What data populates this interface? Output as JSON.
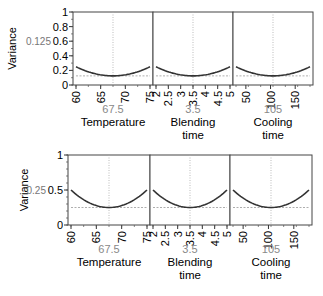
{
  "chart_data": [
    {
      "type": "line",
      "title": "Prediction variance profile (top)",
      "ylabel": "Variance",
      "y_current_value": "0.125",
      "ylim": [
        0,
        1
      ],
      "yticks": [
        "0",
        "0.2",
        "0.4",
        "0.6",
        "0.8",
        "1"
      ],
      "reference_line_y": 0.125,
      "panels": [
        {
          "factor": "Temperature",
          "current": "67.5",
          "xlim": [
            60,
            75
          ],
          "xticks": [
            "60",
            "65",
            "70",
            "75"
          ],
          "x": [
            60,
            62.5,
            65,
            67.5,
            70,
            72.5,
            75
          ],
          "y": [
            0.25,
            0.18,
            0.14,
            0.125,
            0.14,
            0.18,
            0.25
          ]
        },
        {
          "factor": "Blending time",
          "current": "3.5",
          "xlim": [
            2,
            5
          ],
          "xticks": [
            "2",
            "2.5",
            "3",
            "3.5",
            "4",
            "4.5",
            "5"
          ],
          "x": [
            2,
            2.5,
            3,
            3.5,
            4,
            4.5,
            5
          ],
          "y": [
            0.25,
            0.18,
            0.14,
            0.125,
            0.14,
            0.18,
            0.25
          ]
        },
        {
          "factor": "Cooling time",
          "current": "105",
          "xlim": [
            30,
            180
          ],
          "xticks": [
            "50",
            "100",
            "150"
          ],
          "x": [
            30,
            55,
            80,
            105,
            130,
            155,
            180
          ],
          "y": [
            0.25,
            0.18,
            0.14,
            0.125,
            0.14,
            0.18,
            0.25
          ]
        }
      ]
    },
    {
      "type": "line",
      "title": "Prediction variance profile (bottom)",
      "ylabel": "Variance",
      "y_current_value": "0.25",
      "ylim": [
        0,
        1
      ],
      "yticks": [
        "0",
        "0.5",
        "1"
      ],
      "reference_line_y": 0.25,
      "panels": [
        {
          "factor": "Temperature",
          "current": "67.5",
          "xlim": [
            60,
            75
          ],
          "xticks": [
            "60",
            "65",
            "70",
            "75"
          ],
          "x": [
            60,
            62.5,
            65,
            67.5,
            70,
            72.5,
            75
          ],
          "y": [
            0.5,
            0.36,
            0.28,
            0.25,
            0.28,
            0.36,
            0.5
          ]
        },
        {
          "factor": "Blending time",
          "current": "3.5",
          "xlim": [
            2,
            5
          ],
          "xticks": [
            "2",
            "2.5",
            "3",
            "3.5",
            "4",
            "4.5",
            "5"
          ],
          "x": [
            2,
            2.5,
            3,
            3.5,
            4,
            4.5,
            5
          ],
          "y": [
            0.5,
            0.36,
            0.28,
            0.25,
            0.28,
            0.36,
            0.5
          ]
        },
        {
          "factor": "Cooling time",
          "current": "105",
          "xlim": [
            30,
            180
          ],
          "xticks": [
            "50",
            "100",
            "150"
          ],
          "x": [
            30,
            55,
            80,
            105,
            130,
            155,
            180
          ],
          "y": [
            0.5,
            0.36,
            0.28,
            0.25,
            0.28,
            0.36,
            0.5
          ]
        }
      ]
    }
  ],
  "labels": {
    "variance": "Variance",
    "top_current": "0.125",
    "bottom_current": "0.25",
    "temperature": "Temperature",
    "temperature_value": "67.5",
    "blending_1": "Blending",
    "blending_2": "time",
    "blending_value": "3.5",
    "cooling_1": "Cooling",
    "cooling_2": "time",
    "cooling_value": "105"
  }
}
